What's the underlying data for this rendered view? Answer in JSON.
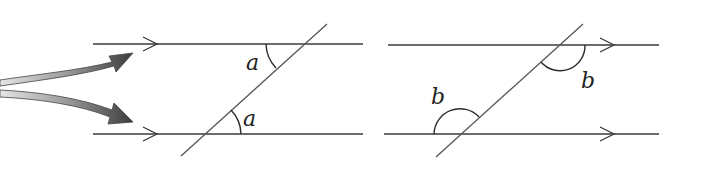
{
  "diagram": {
    "title": "",
    "left_figure": {
      "description": "Alternate angles between parallel lines",
      "angle_labels": [
        "a",
        "a"
      ]
    },
    "right_figure": {
      "description": "Co-interior/corresponding obtuse angles between parallel lines",
      "angle_labels": [
        "b",
        "b"
      ]
    },
    "pointer_arrows": {
      "count": 2,
      "color_dark": "#3c3c3c",
      "color_light": "#d8d8d8"
    },
    "colors": {
      "line": "#3a3a3a",
      "background": "#ffffff"
    }
  }
}
